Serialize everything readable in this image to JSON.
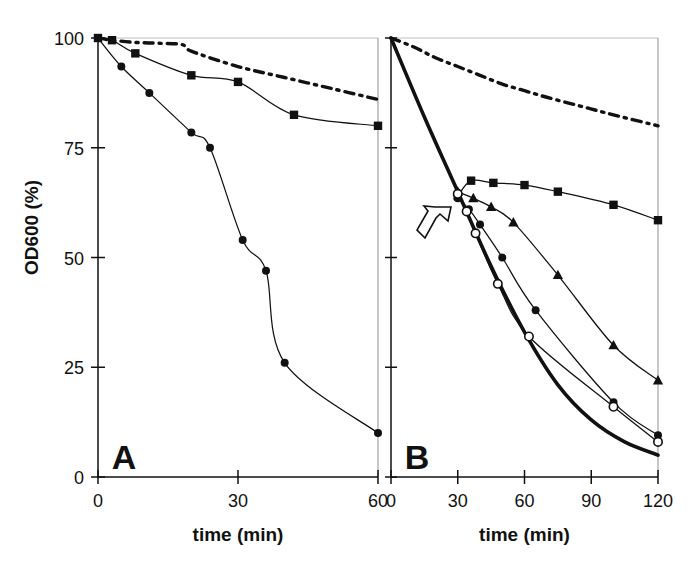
{
  "figure": {
    "ylabel": "OD600 (%)",
    "panels": [
      {
        "letter": "A",
        "xlabel": "time (min)",
        "xticks": [
          "0",
          "30",
          "60"
        ],
        "yticks": [
          "0",
          "25",
          "50",
          "75",
          "100"
        ]
      },
      {
        "letter": "B",
        "xlabel": "time (min)",
        "xticks": [
          "0",
          "30",
          "60",
          "90",
          "120"
        ],
        "yticks": [
          "",
          "",
          "",
          "",
          ""
        ]
      }
    ],
    "annotation": {
      "arrow": "open-arrow-marker"
    },
    "colors": {
      "ink": "#111111",
      "background": "#ffffff"
    }
  },
  "chart_data": [
    {
      "type": "line",
      "title": "A",
      "xlabel": "time (min)",
      "ylabel": "OD600 (%)",
      "xlim": [
        0,
        60
      ],
      "ylim": [
        0,
        100
      ],
      "xticks": [
        0,
        30,
        60
      ],
      "yticks": [
        0,
        25,
        50,
        75,
        100
      ],
      "grid": false,
      "legend": "none",
      "series": [
        {
          "name": "control (dash-dot, no marker)",
          "marker": "none",
          "linestyle": "dash-dot",
          "x": [
            0,
            3,
            8,
            13,
            18,
            20,
            30,
            40,
            50,
            60
          ],
          "y": [
            100,
            99.5,
            99,
            98.8,
            98.5,
            97,
            93.5,
            91,
            88.5,
            86
          ]
        },
        {
          "name": "filled squares",
          "marker": "filled-square",
          "linestyle": "solid",
          "x": [
            0,
            3,
            8,
            20,
            30,
            42,
            60
          ],
          "y": [
            100,
            99.5,
            96.5,
            91.5,
            90,
            82.5,
            80
          ]
        },
        {
          "name": "filled circles",
          "marker": "filled-circle",
          "linestyle": "solid",
          "x": [
            0,
            5,
            11,
            20,
            24,
            31,
            36,
            40,
            60
          ],
          "y": [
            100,
            93.5,
            87.5,
            78.5,
            75,
            54,
            47,
            26,
            10
          ]
        }
      ]
    },
    {
      "type": "line",
      "title": "B",
      "xlabel": "time (min)",
      "ylabel": "OD600 (%)",
      "xlim": [
        0,
        120
      ],
      "ylim": [
        0,
        100
      ],
      "xticks": [
        0,
        30,
        60,
        90,
        120
      ],
      "yticks": [
        0,
        25,
        50,
        75,
        100
      ],
      "grid": false,
      "legend": "none",
      "annotation": {
        "arrow_points_to": {
          "x": 31,
          "y": 64
        },
        "label": "branch point"
      },
      "series": [
        {
          "name": "control (dash-dot, no marker)",
          "marker": "none",
          "linestyle": "dash-dot",
          "x": [
            0,
            10,
            20,
            30,
            40,
            50,
            60,
            70,
            85,
            100,
            120
          ],
          "y": [
            100,
            98,
            95.5,
            93.5,
            91.5,
            89.5,
            88,
            86.5,
            84.5,
            82.5,
            80
          ]
        },
        {
          "name": "untreated lysis (thick solid, no marker)",
          "marker": "none",
          "linestyle": "thick-solid",
          "x": [
            0,
            15,
            30,
            45,
            60,
            75,
            90,
            105,
            120
          ],
          "y": [
            100,
            82,
            65,
            48,
            33,
            21,
            13,
            8,
            5
          ]
        },
        {
          "name": "filled squares",
          "marker": "filled-square",
          "linestyle": "solid",
          "x": [
            30,
            36,
            46,
            60,
            75,
            100,
            120
          ],
          "y": [
            64,
            67.5,
            67,
            66.5,
            65,
            62,
            58.5
          ]
        },
        {
          "name": "filled triangles",
          "marker": "filled-triangle",
          "linestyle": "solid",
          "x": [
            30,
            37,
            45,
            55,
            75,
            100,
            120
          ],
          "y": [
            65,
            63.5,
            61.5,
            58,
            46,
            30,
            22
          ]
        },
        {
          "name": "filled circles",
          "marker": "filled-circle",
          "linestyle": "solid",
          "x": [
            30,
            35,
            40,
            50,
            65,
            100,
            120
          ],
          "y": [
            63.5,
            61,
            57.5,
            50,
            38,
            17,
            9.5
          ]
        },
        {
          "name": "open circles",
          "marker": "open-circle",
          "linestyle": "solid",
          "x": [
            30,
            34,
            38,
            48,
            62,
            100,
            120
          ],
          "y": [
            64.5,
            60.5,
            55.5,
            44,
            32,
            16,
            8
          ]
        }
      ]
    }
  ]
}
